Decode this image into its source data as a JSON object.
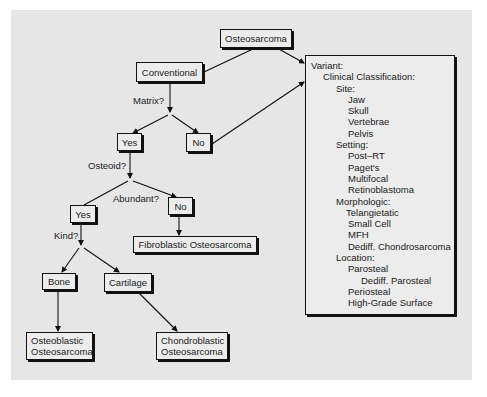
{
  "diagram": {
    "type": "decision-tree",
    "title": "Osteosarcoma",
    "nodes": {
      "root": "Osteosarcoma",
      "conventional": "Conventional",
      "matrix_yes": "Yes",
      "matrix_no": "No",
      "osteoid_yes": "Yes",
      "abundant_no": "No",
      "fibroblastic": "Fibroblastic Osteosarcoma",
      "bone": "Bone",
      "cartilage": "Cartilage",
      "osteoblastic_line1": "Osteoblastic",
      "osteoblastic_line2": "Osteosarcoma",
      "chondroblastic_line1": "Chondroblastic",
      "chondroblastic_line2": "Osteosarcoma"
    },
    "questions": {
      "matrix": "Matrix?",
      "osteoid": "Osteoid?",
      "abundant": "Abundant?",
      "kind": "Kind?"
    },
    "variant": {
      "lines": [
        {
          "text": "Variant:",
          "level": 0
        },
        {
          "text": "Clinical Classification:",
          "level": 1
        },
        {
          "text": "Site:",
          "level": 2
        },
        {
          "text": "Jaw",
          "level": 3
        },
        {
          "text": "Skull",
          "level": 3
        },
        {
          "text": "Vertebrae",
          "level": 3
        },
        {
          "text": "Pelvis",
          "level": 3
        },
        {
          "text": "Setting:",
          "level": 2
        },
        {
          "text": "Post–RT",
          "level": 3
        },
        {
          "text": "Paget's",
          "level": 3
        },
        {
          "text": "Multifocal",
          "level": 3
        },
        {
          "text": "Retinoblastoma",
          "level": 3
        },
        {
          "text": "Morphologic:",
          "level": 2
        },
        {
          "text": "Telangietatic",
          "level": 3
        },
        {
          "text": "Small Cell",
          "level": 3
        },
        {
          "text": "MFH",
          "level": 3
        },
        {
          "text": "Dediff. Chondrosarcoma",
          "level": 3
        },
        {
          "text": "Location:",
          "level": 2
        },
        {
          "text": "Parosteal",
          "level": 3
        },
        {
          "text": "Dediff. Parosteal",
          "level": 4
        },
        {
          "text": "Periosteal",
          "level": 3
        },
        {
          "text": "High-Grade Surface",
          "level": 3
        }
      ]
    },
    "colors": {
      "panel": "#e6e6e6",
      "box": "#ececec",
      "line": "#111111"
    }
  }
}
